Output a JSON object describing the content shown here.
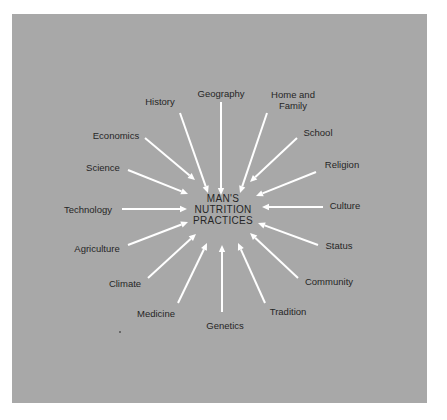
{
  "diagram": {
    "type": "radial-influence-diagram",
    "center": {
      "lines": [
        "MAN'S",
        "NUTRITION",
        "PRACTICES"
      ]
    },
    "colors": {
      "page": "#ffffff",
      "panel": "#a8a8a8",
      "arrow": "#ffffff",
      "text": "#262626"
    },
    "factors": [
      {
        "label": "Geography",
        "lx": 221,
        "ly": 93,
        "x1": 221,
        "y1": 102,
        "x2": 221,
        "y2": 195
      },
      {
        "label": "History",
        "lx": 160,
        "ly": 101,
        "x1": 180,
        "y1": 113,
        "x2": 208,
        "y2": 193
      },
      {
        "label": "Home and Family",
        "lx": 293,
        "ly": 100,
        "x1": 267,
        "y1": 113,
        "x2": 240,
        "y2": 193
      },
      {
        "label": "Economics",
        "lx": 116,
        "ly": 135,
        "x1": 145,
        "y1": 138,
        "x2": 195,
        "y2": 180
      },
      {
        "label": "School",
        "lx": 318,
        "ly": 132,
        "x1": 297,
        "y1": 138,
        "x2": 250,
        "y2": 182
      },
      {
        "label": "Science",
        "lx": 103,
        "ly": 167,
        "x1": 128,
        "y1": 170,
        "x2": 188,
        "y2": 194
      },
      {
        "label": "Religion",
        "lx": 342,
        "ly": 164,
        "x1": 316,
        "y1": 172,
        "x2": 256,
        "y2": 196
      },
      {
        "label": "Technology",
        "lx": 88,
        "ly": 209,
        "x1": 122,
        "y1": 209,
        "x2": 187,
        "y2": 209
      },
      {
        "label": "Culture",
        "lx": 345,
        "ly": 205,
        "x1": 323,
        "y1": 207,
        "x2": 262,
        "y2": 207
      },
      {
        "label": "Agriculture",
        "lx": 97,
        "ly": 248,
        "x1": 128,
        "y1": 245,
        "x2": 188,
        "y2": 222
      },
      {
        "label": "Status",
        "lx": 339,
        "ly": 245,
        "x1": 318,
        "y1": 245,
        "x2": 258,
        "y2": 223
      },
      {
        "label": "Climate",
        "lx": 125,
        "ly": 283,
        "x1": 148,
        "y1": 278,
        "x2": 196,
        "y2": 234
      },
      {
        "label": "Community",
        "lx": 329,
        "ly": 281,
        "x1": 298,
        "y1": 278,
        "x2": 250,
        "y2": 233
      },
      {
        "label": "Medicine",
        "lx": 156,
        "ly": 313,
        "x1": 178,
        "y1": 303,
        "x2": 207,
        "y2": 243
      },
      {
        "label": "Genetics",
        "lx": 225,
        "ly": 325,
        "x1": 222,
        "y1": 312,
        "x2": 222,
        "y2": 245
      },
      {
        "label": "Tradition",
        "lx": 288,
        "ly": 311,
        "x1": 265,
        "y1": 303,
        "x2": 238,
        "y2": 243
      }
    ]
  }
}
